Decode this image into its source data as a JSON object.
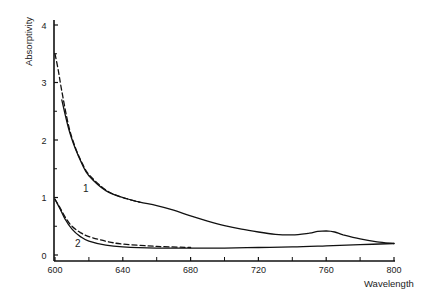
{
  "chart_data": {
    "type": "line",
    "title": "",
    "xlabel": "Wavelength",
    "ylabel": "Absorptivity",
    "xlim": [
      600,
      800
    ],
    "ylim": [
      0,
      4
    ],
    "x_ticks": [
      600,
      640,
      680,
      720,
      760,
      800
    ],
    "x_minor_ticks": [
      620,
      660,
      700,
      740,
      780
    ],
    "y_ticks": [
      0,
      1,
      2,
      3,
      4
    ],
    "y_minor_ticks": [
      0.5,
      1.5,
      2.5,
      3.5
    ],
    "grid": false,
    "legend": "none (curves labeled inline as 1 and 2)",
    "annotations": [
      {
        "text": "1",
        "x": 616,
        "y": 1.15
      },
      {
        "text": "2",
        "x": 612,
        "y": 0.2
      }
    ],
    "series": [
      {
        "name": "1 (solid)",
        "style": "solid",
        "x": [
          604,
          608,
          612,
          616,
          620,
          630,
          640,
          650,
          660,
          670,
          680,
          690,
          700,
          710,
          720,
          730,
          740,
          750,
          755,
          760,
          765,
          770,
          780,
          790,
          800
        ],
        "y": [
          2.7,
          2.2,
          1.85,
          1.58,
          1.38,
          1.12,
          1.0,
          0.92,
          0.86,
          0.78,
          0.68,
          0.59,
          0.51,
          0.45,
          0.4,
          0.36,
          0.35,
          0.38,
          0.41,
          0.42,
          0.4,
          0.35,
          0.28,
          0.23,
          0.2
        ]
      },
      {
        "name": "1 (dashed)",
        "style": "dashed",
        "x": [
          600,
          602,
          604,
          608,
          612,
          616,
          620,
          630,
          640,
          650
        ],
        "y": [
          3.5,
          3.2,
          2.85,
          2.25,
          1.87,
          1.6,
          1.4,
          1.13,
          1.0,
          0.92
        ]
      },
      {
        "name": "2 (solid)",
        "style": "solid",
        "x": [
          600,
          603,
          606,
          610,
          615,
          620,
          630,
          640,
          660,
          680,
          700,
          720,
          740,
          760,
          780,
          800
        ],
        "y": [
          0.97,
          0.8,
          0.62,
          0.45,
          0.32,
          0.24,
          0.17,
          0.14,
          0.12,
          0.12,
          0.12,
          0.13,
          0.14,
          0.16,
          0.18,
          0.2
        ]
      },
      {
        "name": "2 (dashed)",
        "style": "dashed",
        "x": [
          600,
          603,
          606,
          610,
          615,
          620,
          630,
          640,
          660,
          680
        ],
        "y": [
          0.97,
          0.82,
          0.66,
          0.5,
          0.39,
          0.32,
          0.24,
          0.19,
          0.15,
          0.13
        ]
      }
    ]
  },
  "axes": {
    "xlabel": "Wavelength",
    "ylabel": "Absorptivity",
    "x_tick_labels": [
      "600",
      "640",
      "680",
      "720",
      "760",
      "800"
    ],
    "y_tick_labels": [
      "0",
      "1",
      "2",
      "3",
      "4"
    ]
  },
  "labels": {
    "curve1": "1",
    "curve2": "2"
  }
}
